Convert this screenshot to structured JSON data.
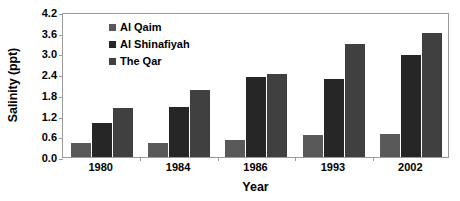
{
  "chart_data": {
    "type": "bar",
    "title": "",
    "xlabel": "Year",
    "ylabel": "Salinity (ppt)",
    "categories": [
      "1980",
      "1984",
      "1986",
      "1993",
      "2002"
    ],
    "series": [
      {
        "name": "Al Qaim",
        "color": "#595959",
        "values": [
          0.42,
          0.42,
          0.5,
          0.65,
          0.68
        ]
      },
      {
        "name": "Al Shinafiyah",
        "color": "#262626",
        "values": [
          0.98,
          1.46,
          2.33,
          2.27,
          2.96
        ]
      },
      {
        "name": "The Qar",
        "color": "#404040",
        "values": [
          1.41,
          1.95,
          2.4,
          3.27,
          3.59
        ]
      }
    ],
    "ylim": [
      0.0,
      4.2
    ],
    "yticks": [
      "0.0",
      "0.6",
      "1.2",
      "1.8",
      "2.4",
      "3.0",
      "3.6",
      "4.2"
    ],
    "ytick_values": [
      0.0,
      0.6,
      1.2,
      1.8,
      2.4,
      3.0,
      3.6,
      4.2
    ],
    "grid": false,
    "legend_position": "top-left",
    "frame_color": "#9a9a9a",
    "background": "#ffffff"
  }
}
